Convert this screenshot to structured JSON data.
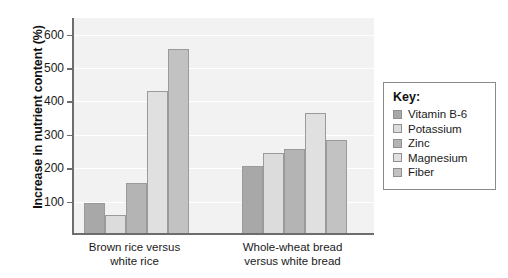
{
  "chart_data": {
    "type": "bar",
    "title": "",
    "xlabel": "",
    "ylabel": "Increase in nutrient content (%)",
    "ylim": [
      0,
      650
    ],
    "yticks": [
      100,
      200,
      300,
      400,
      500,
      600
    ],
    "grid": true,
    "legend_position": "right",
    "categories": [
      "Brown rice versus white rice",
      "Whole-wheat bread versus white bread"
    ],
    "category_lines": [
      [
        "Brown rice versus",
        "white rice"
      ],
      [
        "Whole-wheat bread",
        "versus white bread"
      ]
    ],
    "series": [
      {
        "name": "Vitamin B-6",
        "color": "#a8a8a8",
        "values": [
          90,
          200
        ]
      },
      {
        "name": "Potassium",
        "color": "#dcdcdc",
        "values": [
          55,
          240
        ]
      },
      {
        "name": "Zinc",
        "color": "#b4b4b4",
        "values": [
          150,
          253
        ]
      },
      {
        "name": "Magnesium",
        "color": "#e0e0e0",
        "values": [
          425,
          358
        ]
      },
      {
        "name": "Fiber",
        "color": "#c2c2c2",
        "values": [
          550,
          278
        ]
      }
    ]
  },
  "legend": {
    "title": "Key:"
  },
  "colors": {
    "plot_background": "#f2f2f2",
    "axis": "#6d6d6d",
    "gridline": "#ffffff",
    "bar_outline": "#9a9a9a",
    "text": "#1a1a1a"
  }
}
